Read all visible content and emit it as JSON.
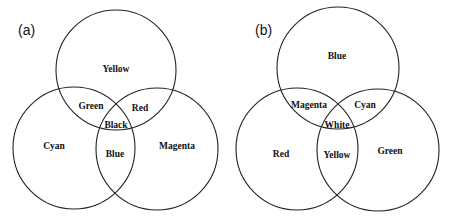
{
  "panels": [
    {
      "label": "(a)",
      "model": "subtractive",
      "regions": {
        "top": "Yellow",
        "left": "Cyan",
        "right": "Magenta",
        "top_left": "Green",
        "top_right": "Red",
        "left_right": "Blue",
        "center": "Black"
      }
    },
    {
      "label": "(b)",
      "model": "additive",
      "regions": {
        "top": "Blue",
        "left": "Red",
        "right": "Green",
        "top_left": "Magenta",
        "top_right": "Cyan",
        "left_right": "Yellow",
        "center": "White"
      }
    }
  ],
  "colors": {
    "stroke": "#222222",
    "text": "#111111",
    "background": "#ffffff"
  }
}
